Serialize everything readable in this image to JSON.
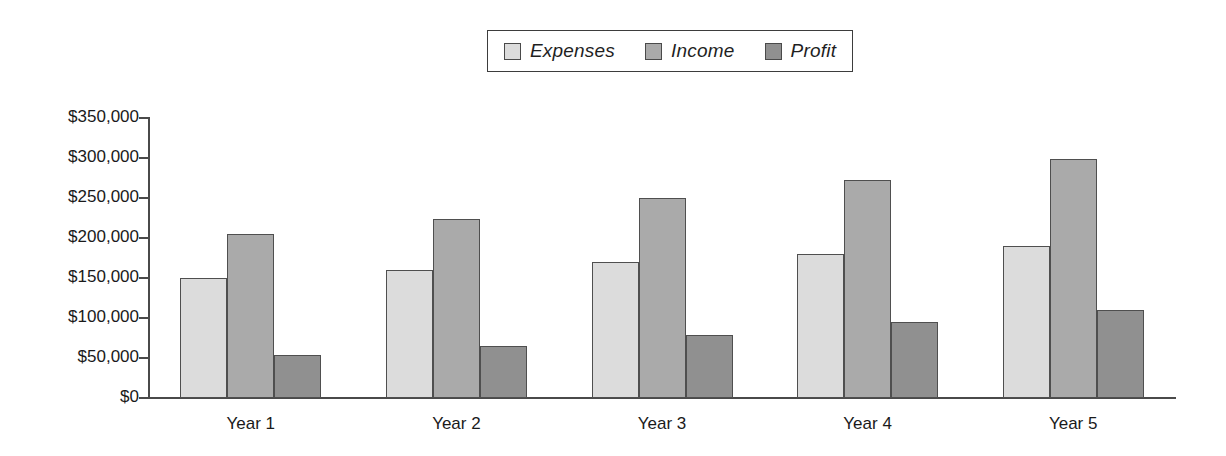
{
  "chart_data": {
    "type": "bar",
    "title": "",
    "xlabel": "",
    "ylabel": "",
    "categories": [
      "Year 1",
      "Year 2",
      "Year 3",
      "Year 4",
      "Year 5"
    ],
    "series": [
      {
        "name": "Expenses",
        "color": "#dcdcdc",
        "values": [
          150000,
          160000,
          170000,
          180000,
          190000
        ]
      },
      {
        "name": "Income",
        "color": "#aaaaaa",
        "values": [
          205000,
          224000,
          250000,
          272000,
          299000
        ]
      },
      {
        "name": "Profit",
        "color": "#909090",
        "values": [
          54000,
          65000,
          79000,
          95000,
          110000
        ]
      }
    ],
    "ylim": [
      0,
      350000
    ],
    "ytick_values": [
      0,
      50000,
      100000,
      150000,
      200000,
      250000,
      300000,
      350000
    ],
    "ytick_labels": [
      "$0",
      "$50,000",
      "$100,000",
      "$150,000",
      "$200,000",
      "$250,000",
      "$300,000",
      "$350,000"
    ],
    "grid": false,
    "legend_position": "top-center"
  }
}
